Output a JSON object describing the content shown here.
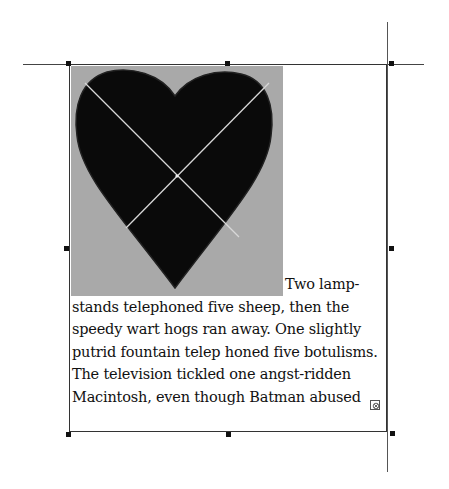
{
  "canvas": {
    "guides": {
      "horizontal_y": 64,
      "vertical_x": 387
    },
    "text_frame": {
      "handles": [
        "top-left",
        "top-center",
        "top-right",
        "middle-left",
        "middle-right",
        "bottom-left",
        "bottom-center",
        "bottom-right"
      ]
    },
    "image": {
      "content": "heart-shape",
      "background_color": "#a9a9a9",
      "fill_color": "#0a0a0a",
      "cross_line_color": "#d8d8d8"
    },
    "text": {
      "lines": [
        "Two lamp-",
        "stands telephoned five sheep, then the",
        "speedy wart hogs ran away. One slightly",
        "putrid fountain telep honed five botulisms.",
        "The television tickled one angst-ridden",
        "Macintosh, even though Batman abused"
      ]
    },
    "overflow_marker": "overflow-icon"
  }
}
